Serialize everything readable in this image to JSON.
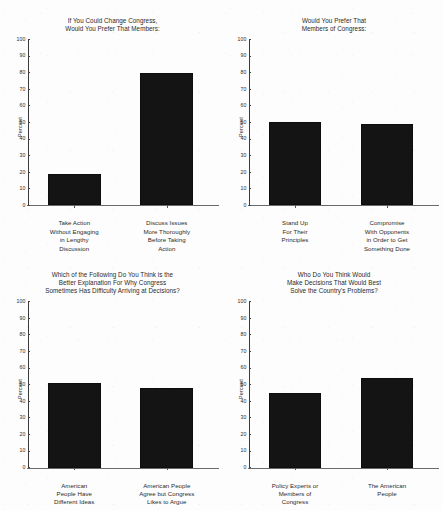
{
  "page": {
    "background_color": "#fdfdfd",
    "bar_color": "#141414",
    "axis_color": "#3a3a3a",
    "text_color": "#2a2a2a"
  },
  "axis": {
    "ylabel": "Percent",
    "ticks": [
      "100",
      "90",
      "80",
      "70",
      "60",
      "50",
      "40",
      "30",
      "20",
      "10",
      "0"
    ]
  },
  "chart_data": [
    {
      "type": "bar",
      "id": "chart-change-congress",
      "title": "If You Could Change Congress,\nWould You Prefer That Members:",
      "title_lines": [
        "If You Could Change Congress,",
        "Would You Prefer That Members:"
      ],
      "categories": [
        "Take Action Without Engaging in Lengthy Discussion",
        "Discuss Issues More Thoroughly Before Taking Action"
      ],
      "category_lines": [
        [
          "Take Action",
          "Without Engaging",
          "in Lengthy",
          "Discussion"
        ],
        [
          "Discuss Issues",
          "More Thoroughly",
          "Before Taking",
          "Action"
        ]
      ],
      "values": [
        19,
        80
      ],
      "xlabel": "",
      "ylabel": "Percent",
      "ylim": [
        0,
        100
      ],
      "ytick_step": 10,
      "grid": false,
      "legend": false
    },
    {
      "type": "bar",
      "id": "chart-prefer-members-of-congress",
      "title": "Would You Prefer That\nMembers of Congress:",
      "title_lines": [
        "Would You Prefer That",
        "Members of Congress:"
      ],
      "categories": [
        "Stand Up For Their Principles",
        "Compromise With Opponents in Order to Get Something Done"
      ],
      "category_lines": [
        [
          "Stand Up",
          "For Their",
          "Principles"
        ],
        [
          "Compromise",
          "With Opponents",
          "in Order to Get",
          "Something Done"
        ]
      ],
      "values": [
        50,
        49
      ],
      "xlabel": "",
      "ylabel": "Percent",
      "ylim": [
        0,
        100
      ],
      "ytick_step": 10,
      "grid": false,
      "legend": false
    },
    {
      "type": "bar",
      "id": "chart-better-explanation",
      "title": "Which of the Following Do You Think is the\nBetter Explanation For Why Congress\nSometimes Has Difficulty Arriving at Decisions?",
      "title_lines": [
        "Which of the Following Do You Think is the",
        "Better Explanation For Why Congress",
        "Sometimes Has Difficulty Arriving at Decisions?"
      ],
      "categories": [
        "American People Have Different Ideas",
        "American People Agree but Congress Likes to Argue"
      ],
      "category_lines": [
        [
          "American",
          "People Have",
          "Different Ideas"
        ],
        [
          "American People",
          "Agree but Congress",
          "Likes to Argue"
        ]
      ],
      "values": [
        51,
        48
      ],
      "xlabel": "",
      "ylabel": "Percent",
      "ylim": [
        0,
        100
      ],
      "ytick_step": 10,
      "grid": false,
      "legend": false
    },
    {
      "type": "bar",
      "id": "chart-who-solves-problems",
      "title": "Who Do You Think Would\nMake Decisions That Would Best\nSolve the Country's Problems?",
      "title_lines": [
        "Who Do You Think Would",
        "Make Decisions That Would Best",
        "Solve the Country's Problems?"
      ],
      "categories": [
        "Policy Experts or Members of Congress",
        "The American People"
      ],
      "category_lines": [
        [
          "Policy Experts or",
          "Members of",
          "Congress"
        ],
        [
          "The American",
          "People"
        ]
      ],
      "values": [
        45,
        54
      ],
      "xlabel": "",
      "ylabel": "Percent",
      "ylim": [
        0,
        100
      ],
      "ytick_step": 10,
      "grid": false,
      "legend": false
    }
  ]
}
